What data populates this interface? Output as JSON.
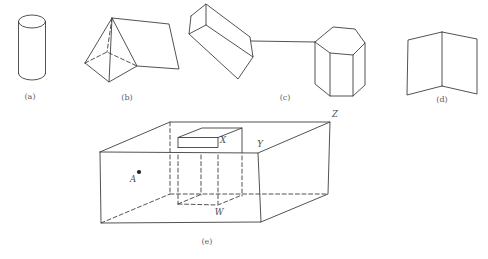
{
  "canvas": {
    "width": 488,
    "height": 259
  },
  "colors": {
    "background": "#ffffff",
    "line": "#3f3f3f",
    "dot": "#222222",
    "figure_label": "#5c5c5c",
    "point_label": "#4c4c4c"
  },
  "figures": [
    {
      "name": "cylinder",
      "label": "(a)",
      "label_pos": [
        30,
        99
      ],
      "solid_polylines": [
        [
          [
            18.5,
            21.5
          ],
          [
            18.5,
            73.5
          ]
        ],
        [
          [
            45.5,
            21.5
          ],
          [
            45.5,
            73.5
          ]
        ]
      ],
      "dashed_polylines": [],
      "ellipses": [
        {
          "cx": 32,
          "cy": 21.5,
          "rx": 13.5,
          "ry": 6.5
        }
      ],
      "half_ellipses": [
        {
          "cx": 32,
          "cy": 73.5,
          "rx": 13.5,
          "ry": 6.5
        }
      ],
      "dots": [],
      "points": []
    },
    {
      "name": "pyramid-prism",
      "label": "(b)",
      "label_pos": [
        127,
        100
      ],
      "solid_polylines": [
        [
          [
            85,
            63
          ],
          [
            112,
            18
          ],
          [
            109,
            82
          ],
          [
            85,
            63
          ]
        ],
        [
          [
            109,
            82
          ],
          [
            137,
            66
          ],
          [
            112,
            18
          ]
        ],
        [
          [
            112,
            18
          ],
          [
            169,
            24
          ],
          [
            179,
            69
          ],
          [
            137,
            66
          ]
        ]
      ],
      "dashed_polylines": [
        [
          [
            85,
            63
          ],
          [
            107,
            52
          ],
          [
            137,
            66
          ]
        ],
        [
          [
            112,
            18
          ],
          [
            107,
            52
          ]
        ]
      ],
      "ellipses": [],
      "half_ellipses": [],
      "dots": [],
      "points": []
    },
    {
      "name": "box-and-hexagonal-prism",
      "label": "(c)",
      "label_pos": [
        285,
        100
      ],
      "solid_polylines": [
        [
          [
            191,
            16
          ],
          [
            206,
            4
          ],
          [
            206,
            25
          ],
          [
            189,
            34
          ],
          [
            191,
            16
          ]
        ],
        [
          [
            206,
            4
          ],
          [
            250,
            37
          ],
          [
            253,
            57
          ],
          [
            206,
            25
          ]
        ],
        [
          [
            189,
            34
          ],
          [
            238,
            79
          ],
          [
            253,
            57
          ]
        ],
        [
          [
            251,
            41
          ],
          [
            315,
            42
          ]
        ],
        [
          [
            315,
            42
          ],
          [
            333,
            27
          ],
          [
            355,
            29
          ],
          [
            365,
            43
          ],
          [
            353,
            55
          ],
          [
            330,
            53
          ],
          [
            315,
            42
          ]
        ],
        [
          [
            315,
            42
          ],
          [
            315,
            84
          ],
          [
            330,
            96
          ],
          [
            353,
            96
          ],
          [
            365,
            85
          ],
          [
            365,
            43
          ]
        ],
        [
          [
            330,
            53
          ],
          [
            330,
            96
          ]
        ],
        [
          [
            353,
            55
          ],
          [
            353,
            96
          ]
        ]
      ],
      "dashed_polylines": [],
      "ellipses": [],
      "half_ellipses": [],
      "dots": [],
      "points": []
    },
    {
      "name": "folded-card",
      "label": "(d)",
      "label_pos": [
        442,
        102
      ],
      "solid_polylines": [
        [
          [
            442,
            32
          ],
          [
            442,
            86
          ]
        ],
        [
          [
            442,
            32
          ],
          [
            408,
            40
          ],
          [
            407,
            95
          ],
          [
            442,
            86
          ]
        ],
        [
          [
            442,
            32
          ],
          [
            477,
            39
          ],
          [
            477,
            94
          ],
          [
            442,
            86
          ]
        ]
      ],
      "dashed_polylines": [],
      "ellipses": [],
      "half_ellipses": [],
      "dots": [],
      "points": []
    },
    {
      "name": "box-with-inner-box",
      "label": "(e)",
      "label_pos": [
        207,
        244
      ],
      "solid_polylines": [
        [
          [
            100,
            152
          ],
          [
            258,
            153
          ],
          [
            261,
            222
          ],
          [
            101,
            223
          ],
          [
            100,
            152
          ]
        ],
        [
          [
            100,
            152
          ],
          [
            170,
            122
          ],
          [
            330,
            122
          ],
          [
            258,
            153
          ]
        ],
        [
          [
            330,
            122
          ],
          [
            328,
            194
          ],
          [
            261,
            222
          ]
        ],
        [
          [
            178,
            147.5
          ],
          [
            178,
            137.5
          ],
          [
            218,
            137.5
          ],
          [
            218,
            147.5
          ],
          [
            178,
            147.5
          ]
        ],
        [
          [
            178,
            137.5
          ],
          [
            202,
            128
          ],
          [
            242,
            128
          ],
          [
            218,
            137.5
          ]
        ],
        [
          [
            242,
            128
          ],
          [
            242,
            153
          ]
        ]
      ],
      "dashed_polylines": [
        [
          [
            170,
            122
          ],
          [
            170,
            194
          ]
        ],
        [
          [
            170,
            194
          ],
          [
            328,
            194
          ]
        ],
        [
          [
            101,
            223
          ],
          [
            170,
            194
          ]
        ],
        [
          [
            178,
            155
          ],
          [
            178,
            204
          ]
        ],
        [
          [
            201,
            155
          ],
          [
            201,
            195
          ]
        ],
        [
          [
            218,
            155
          ],
          [
            218,
            204
          ]
        ],
        [
          [
            242,
            156
          ],
          [
            242,
            196
          ]
        ],
        [
          [
            178,
            204
          ],
          [
            218,
            205
          ],
          [
            242,
            195
          ]
        ],
        [
          [
            178,
            204
          ],
          [
            202,
            194
          ]
        ]
      ],
      "ellipses": [],
      "half_ellipses": [],
      "dots": [
        {
          "x": 139,
          "y": 172,
          "r": 2.1
        }
      ],
      "points": [
        {
          "text": "A",
          "x": 133,
          "y": 182
        },
        {
          "text": "W",
          "x": 219,
          "y": 215
        },
        {
          "text": "X",
          "x": 223,
          "y": 143
        },
        {
          "text": "Y",
          "x": 260,
          "y": 147
        },
        {
          "text": "Z",
          "x": 335,
          "y": 117
        }
      ]
    }
  ]
}
